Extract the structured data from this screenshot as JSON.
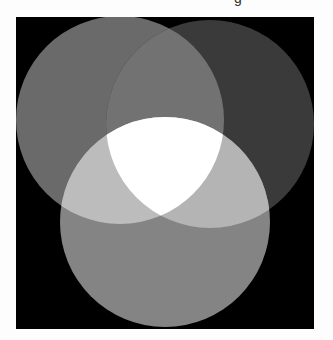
{
  "header": {
    "caption_fragment": "g"
  },
  "figure": {
    "background": "#000000",
    "circles": [
      {
        "id": "top-left",
        "cx": 104,
        "cy": 103,
        "r": 104,
        "fill": "#6a6a6a"
      },
      {
        "id": "top-right",
        "cx": 194,
        "cy": 107,
        "r": 104,
        "fill": "#3a3a3a"
      },
      {
        "id": "bottom",
        "cx": 149,
        "cy": 205,
        "r": 105,
        "fill": "#848484"
      }
    ],
    "overlaps": {
      "top_left_top_right": "#727272",
      "top_left_bottom": "#bcbcbc",
      "top_right_bottom": "#b4b4b4",
      "all_three": "#ffffff"
    }
  }
}
